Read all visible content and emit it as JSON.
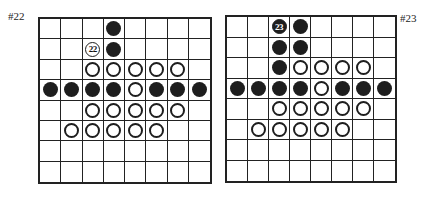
{
  "boards": [
    {
      "label": "#22",
      "label_pos": {
        "x": 8,
        "y": 10
      },
      "rect": {
        "x": 38,
        "y": 17,
        "w": 174,
        "h": 167
      },
      "grid": [
        "...B....",
        "..nB....",
        "..WWWWW.",
        "BBBBWBBB",
        "..WWWWW.",
        ".WWWWW..",
        "........",
        "........"
      ],
      "numbered_stone": {
        "row": 1,
        "col": 2,
        "number": "22",
        "color": "white"
      }
    },
    {
      "label": "#23",
      "label_pos": {
        "x": 400,
        "y": 12
      },
      "rect": {
        "x": 225,
        "y": 15,
        "w": 172,
        "h": 168
      },
      "grid": [
        "..nB....",
        "..BB....",
        "..BWWWW.",
        "BBBBWBBB",
        "..WWWWW.",
        ".WWWWW..",
        "........",
        "........"
      ],
      "numbered_stone": {
        "row": 0,
        "col": 2,
        "number": "23",
        "color": "black"
      }
    }
  ]
}
